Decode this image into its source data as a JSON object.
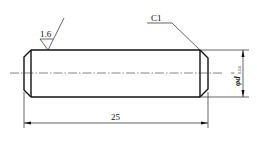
{
  "drawing": {
    "title": "Cylindrical pin",
    "surface_roughness": "1.6",
    "chamfer_label": "C1",
    "length_dimension": "25",
    "diameter_symbol": "φd",
    "diameter_tolerance_upper": "0",
    "diameter_tolerance_lower": "0.04",
    "diameter_label": "φd",
    "colors": {
      "line": "#111111",
      "background": "#ffffff"
    }
  }
}
